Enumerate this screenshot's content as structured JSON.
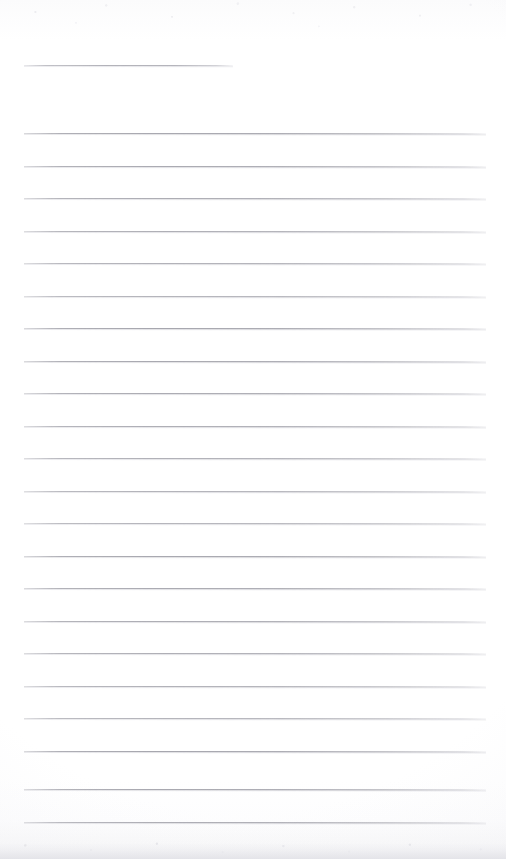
{
  "document": {
    "kind": "scanned-ruled-notepad-page",
    "title": "Blank Ruled Notepad Page",
    "page_width": 506,
    "page_height": 859,
    "paper_color": "#fefefe",
    "rule_color": "#8d8d97",
    "rule_color_faint": "#bababf",
    "edge_shadow_color": "#e2e2e7",
    "text_content": "",
    "handwriting_present": "no",
    "visible_text_items": []
  },
  "ruling": {
    "line_count": 23,
    "full_line_count": 22,
    "short_line_count": 1,
    "line_spacing_px": 32.5,
    "line_thickness_px": 1,
    "left_margin_px": 24,
    "right_margin_px": 20,
    "first_line_y": 65,
    "last_line_y": 822,
    "lines": [
      {
        "id": "rule-01",
        "y": 65,
        "x": 24,
        "width": 209,
        "variant": "short"
      },
      {
        "id": "rule-02",
        "y": 133,
        "x": 24,
        "width": 462,
        "variant": "full"
      },
      {
        "id": "rule-03",
        "y": 165.5,
        "x": 24,
        "width": 462,
        "variant": "full"
      },
      {
        "id": "rule-04",
        "y": 198,
        "x": 24,
        "width": 462,
        "variant": "full"
      },
      {
        "id": "rule-05",
        "y": 230.5,
        "x": 24,
        "width": 462,
        "variant": "full"
      },
      {
        "id": "rule-06",
        "y": 263,
        "x": 24,
        "width": 462,
        "variant": "full"
      },
      {
        "id": "rule-07",
        "y": 295.5,
        "x": 24,
        "width": 462,
        "variant": "full"
      },
      {
        "id": "rule-08",
        "y": 328,
        "x": 24,
        "width": 462,
        "variant": "full"
      },
      {
        "id": "rule-09",
        "y": 360.5,
        "x": 24,
        "width": 462,
        "variant": "full"
      },
      {
        "id": "rule-10",
        "y": 393,
        "x": 24,
        "width": 462,
        "variant": "full"
      },
      {
        "id": "rule-11",
        "y": 425.5,
        "x": 24,
        "width": 462,
        "variant": "full"
      },
      {
        "id": "rule-12",
        "y": 458,
        "x": 24,
        "width": 462,
        "variant": "full"
      },
      {
        "id": "rule-13",
        "y": 490.5,
        "x": 24,
        "width": 462,
        "variant": "full"
      },
      {
        "id": "rule-14",
        "y": 523,
        "x": 24,
        "width": 462,
        "variant": "full"
      },
      {
        "id": "rule-15",
        "y": 555.5,
        "x": 24,
        "width": 462,
        "variant": "full"
      },
      {
        "id": "rule-16",
        "y": 588,
        "x": 24,
        "width": 462,
        "variant": "full"
      },
      {
        "id": "rule-17",
        "y": 620.5,
        "x": 24,
        "width": 462,
        "variant": "full"
      },
      {
        "id": "rule-18",
        "y": 653,
        "x": 24,
        "width": 462,
        "variant": "full"
      },
      {
        "id": "rule-19",
        "y": 685.5,
        "x": 24,
        "width": 462,
        "variant": "full"
      },
      {
        "id": "rule-20",
        "y": 718,
        "x": 24,
        "width": 462,
        "variant": "full"
      },
      {
        "id": "rule-21",
        "y": 750.5,
        "x": 24,
        "width": 462,
        "variant": "full"
      },
      {
        "id": "rule-22",
        "y": 789,
        "x": 24,
        "width": 462,
        "variant": "full"
      },
      {
        "id": "rule-23",
        "y": 822,
        "x": 24,
        "width": 462,
        "variant": "full"
      }
    ]
  },
  "scan_artifacts": {
    "top_speckle": "faint mottled grey speckle across upper edge",
    "bottom_edge_shadow": "soft grey gradient along bottom paper edge",
    "vignette": "slight darkening toward page corners"
  }
}
